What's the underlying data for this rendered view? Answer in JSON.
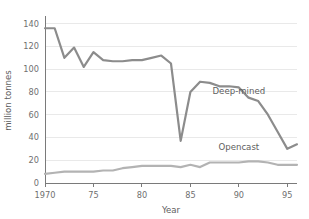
{
  "chart_data": {
    "type": "line",
    "title": "",
    "subtitle": "",
    "xlabel": "Year",
    "ylabel": "million tonnes",
    "xlim": [
      1970,
      1996
    ],
    "ylim": [
      0,
      145
    ],
    "xticks": [
      1970,
      1975,
      1980,
      1985,
      1990,
      1995
    ],
    "xticklabels": [
      "1970",
      "75",
      "80",
      "85",
      "90",
      "95"
    ],
    "yticks": [
      0,
      20,
      40,
      60,
      80,
      100,
      120,
      140
    ],
    "yticklabels": [
      "0",
      "20",
      "40",
      "60",
      "80",
      "100",
      "120",
      "140"
    ],
    "grid": "horizontal",
    "legend_position": "inline-annotation",
    "x": [
      1970,
      1971,
      1972,
      1973,
      1974,
      1975,
      1976,
      1977,
      1978,
      1979,
      1980,
      1981,
      1982,
      1983,
      1984,
      1985,
      1986,
      1987,
      1988,
      1989,
      1990,
      1991,
      1992,
      1993,
      1994,
      1995,
      1996
    ],
    "series": [
      {
        "name": "Deep-mined",
        "color": "#8c8c8c",
        "label_x": 1990,
        "label_y": 78,
        "values": [
          136,
          136,
          110,
          119,
          102,
          115,
          108,
          107,
          107,
          108,
          108,
          110,
          112,
          105,
          37,
          80,
          89,
          88,
          85,
          85,
          84,
          75,
          72,
          60,
          45,
          30,
          34
        ]
      },
      {
        "name": "Opencast",
        "color": "#b3b3b3",
        "label_x": 1990,
        "label_y": 29,
        "values": [
          8,
          9,
          10,
          10,
          10,
          10,
          11,
          11,
          13,
          14,
          15,
          15,
          15,
          15,
          14,
          16,
          14,
          18,
          18,
          18,
          18,
          19,
          19,
          18,
          16,
          16,
          16
        ]
      }
    ]
  },
  "figure": {
    "background": "#ffffff",
    "plot_left": 45,
    "plot_right": 297,
    "plot_top": 18,
    "plot_bottom": 183
  }
}
